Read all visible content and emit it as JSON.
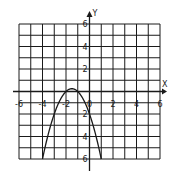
{
  "chart_data": {
    "type": "line",
    "title": "",
    "xlabel": "X",
    "ylabel": "Y",
    "xlim": [
      -6,
      6
    ],
    "ylim": [
      -6,
      6
    ],
    "grid": true,
    "grid_step": 1,
    "x_tick_labels": [
      "-6",
      "-4",
      "-2",
      "0",
      "2",
      "4",
      "6"
    ],
    "x_tick_values": [
      -6,
      -4,
      -2,
      0,
      2,
      4,
      6
    ],
    "y_tick_labels": [
      "6",
      "4",
      "2",
      "2",
      "4",
      "6"
    ],
    "y_tick_values": [
      6,
      4,
      2,
      -2,
      -4,
      -6
    ],
    "series": [
      {
        "name": "f(x) = -x^2 - 3x - 2",
        "x": [
          -4,
          -3.5,
          -3,
          -2.5,
          -2,
          -1.5,
          -1,
          -0.5,
          0,
          0.5,
          1
        ],
        "y": [
          -6,
          -3.75,
          -2,
          -0.75,
          0,
          0.25,
          0,
          -0.75,
          -2,
          -3.75,
          -6
        ]
      }
    ],
    "colors": {
      "grid": "#1a1a1a",
      "curve": "#1a1a1a",
      "background": "#ffffff"
    }
  }
}
